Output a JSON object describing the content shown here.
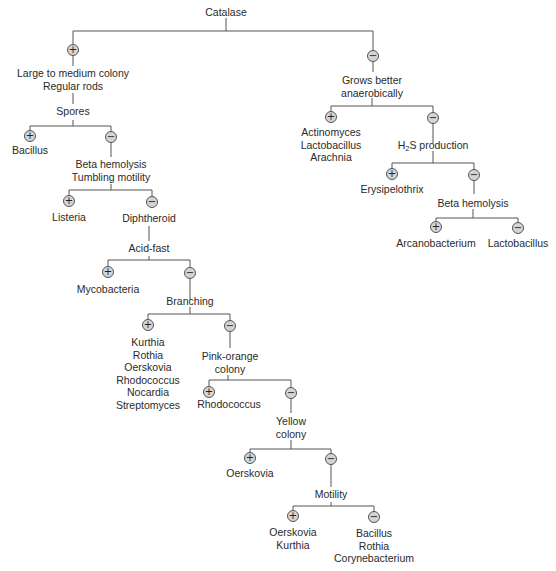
{
  "title": "Catalase",
  "nodes": {
    "catalase": "Catalase",
    "large_colony": "Large to medium colony\nRegular rods",
    "spores": "Spores",
    "bacillus": "Bacillus",
    "beta_tumbling": "Beta hemolysis\nTumbling motility",
    "listeria": "Listeria",
    "diphtheroid": "Diphtheroid",
    "acid_fast": "Acid-fast",
    "mycobacteria": "Mycobacteria",
    "branching": "Branching",
    "branching_pos": "Kurthia\nRothia\nOerskovia\nRhodococcus\nNocardia\nStreptomyces",
    "pink_orange": "Pink-orange\ncolony",
    "rhodococcus": "Rhodococcus",
    "yellow": "Yellow\ncolony",
    "oerskovia": "Oerskovia",
    "motility": "Motility",
    "motility_pos": "Oerskovia\nKurthia",
    "motility_neg": "Bacillus\nRothia\nCorynebacterium",
    "anaerobic": "Grows better\nanaerobically",
    "anaerobic_pos": "Actinomyces\nLactobacillus\nArachnia",
    "h2s_prefix": "H",
    "h2s_sub": "2",
    "h2s_suffix": "S production",
    "erysipelothrix": "Erysipelothrix",
    "beta_hemolysis": "Beta hemolysis",
    "arcanobacterium": "Arcanobacterium",
    "lactobacillus": "Lactobacillus"
  },
  "signs": {
    "plus": "+",
    "minus": "−"
  },
  "colors": {
    "sign_fill": "#d4d4d4",
    "line": "#555555",
    "text": "#2a2a2a"
  }
}
